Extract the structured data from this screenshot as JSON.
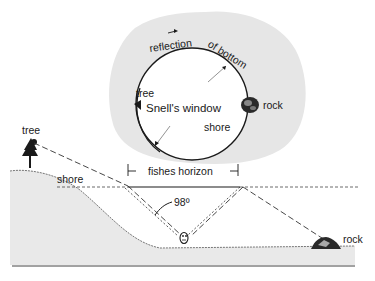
{
  "diagram": {
    "type": "optics-illustration",
    "window_view": {
      "center_label": "Snell's window",
      "arc_label_1": "reflection",
      "arc_label_2": "of bottom",
      "inner_labels": {
        "tree": "tree",
        "shore": "shore"
      },
      "outside_label": "rock"
    },
    "cross_section": {
      "tree_label": "tree",
      "shore_label": "shore",
      "rock_label": "rock",
      "horizon_label": "fishes horizon",
      "angle_label": "98º"
    },
    "colors": {
      "ink": "#1a1a1a",
      "halo_gray": "#e6e6e6",
      "ground_gray": "#e9e9e9",
      "background": "#ffffff"
    }
  }
}
